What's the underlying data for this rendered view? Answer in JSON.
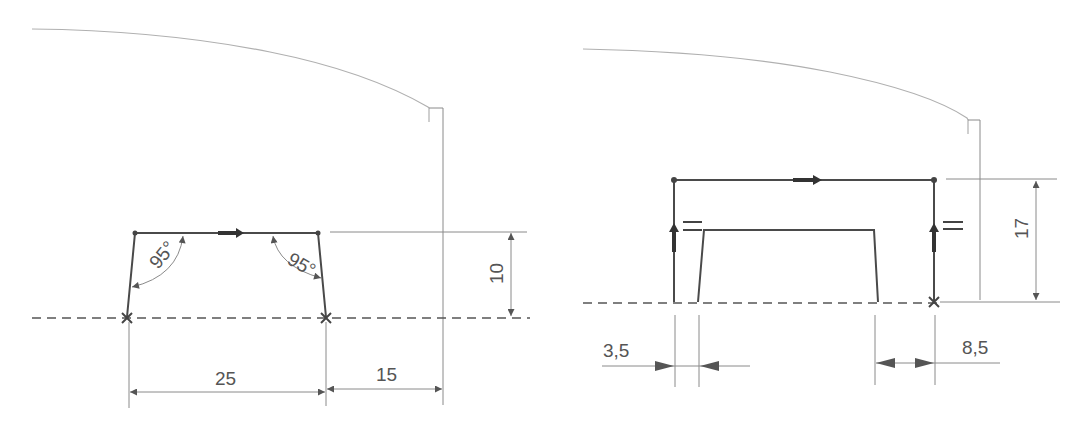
{
  "diagram": {
    "type": "technical-drawing",
    "panels": [
      {
        "id": "left",
        "labels": {
          "angle_left": "95°",
          "angle_right": "95°",
          "dim_height": "10",
          "dim_width": "25",
          "dim_offset": "15"
        }
      },
      {
        "id": "right",
        "labels": {
          "dim_height": "17",
          "dim_left_offset": "3,5",
          "dim_right_offset": "8,5",
          "equal_mark_left": "=",
          "equal_mark_right": "="
        }
      }
    ],
    "colors": {
      "line": "#4a4a4a",
      "thin": "#8a8a8a",
      "outline": "#b0b0b0",
      "background": "#ffffff"
    }
  }
}
